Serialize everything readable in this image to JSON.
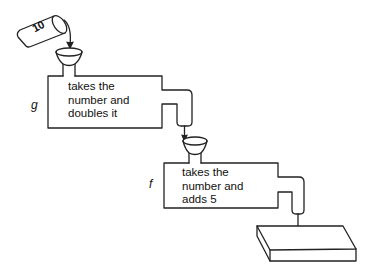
{
  "diagram": {
    "type": "function-machine",
    "input": {
      "value": "10",
      "object": "tilted cup pouring into funnel"
    },
    "machines": [
      {
        "name": "g",
        "lines": [
          "takes the",
          "number and",
          "doubles it"
        ]
      },
      {
        "name": "f",
        "lines": [
          "takes the",
          "number and",
          "adds 5"
        ]
      }
    ],
    "output": {
      "object": "empty tray"
    },
    "colors": {
      "stroke": "#222222",
      "background": "#ffffff"
    }
  }
}
